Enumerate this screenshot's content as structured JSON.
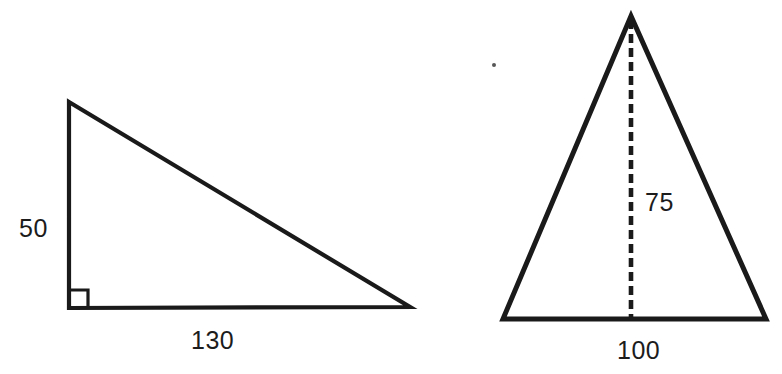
{
  "document": {
    "kind": "geometry-worksheet-figure",
    "background_color": "#ffffff",
    "ink_color": "#1a1a1a",
    "width": 782,
    "height": 374
  },
  "figures": [
    {
      "id": "right-triangle",
      "name": "Right triangle with leg dimensions",
      "shape": "right-triangle",
      "right_angle_marked": true,
      "vertices": {
        "top": [
          69,
          102
        ],
        "bottom_left": [
          69,
          308
        ],
        "bottom_right": [
          410,
          307
        ]
      },
      "right_angle_marker": {
        "x": 71,
        "y": 290,
        "size": 17
      },
      "labels": [
        {
          "id": "label-50",
          "text": "50",
          "side": "vertical-leg",
          "x": 19,
          "y": 216
        },
        {
          "id": "label-130",
          "text": "130",
          "side": "horizontal-leg",
          "x": 191,
          "y": 328
        }
      ]
    },
    {
      "id": "isosceles-triangle",
      "name": "Isosceles triangle with dashed height",
      "shape": "isosceles-triangle",
      "height_line_style": "dashed",
      "vertices": {
        "apex": [
          631,
          16
        ],
        "bottom_left": [
          503,
          319
        ],
        "bottom_right": [
          766,
          319
        ]
      },
      "height_line": {
        "x": 631,
        "y_top": 20,
        "y_bottom": 318
      },
      "labels": [
        {
          "id": "label-75",
          "text": "75",
          "side": "height",
          "x": 645,
          "y": 190
        },
        {
          "id": "label-100",
          "text": "100",
          "side": "base",
          "x": 617,
          "y": 338
        }
      ]
    }
  ],
  "artifacts": [
    {
      "id": "scan-speck",
      "name": "scan-speck",
      "x": 492,
      "y": 63
    }
  ],
  "text_values": {
    "left_triangle_height": "50",
    "left_triangle_base": "130",
    "right_triangle_height": "75",
    "right_triangle_base": "100"
  }
}
